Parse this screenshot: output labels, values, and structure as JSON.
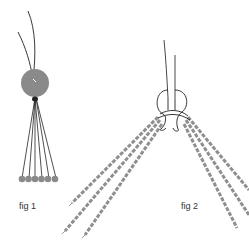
{
  "figures": [
    {
      "id": "fig1",
      "label": "fig 1",
      "description": "Bead with two threads passing through the top and six strands fanning down to a row of six small beads",
      "bead_color": "#8a8a8a",
      "strand_count": 6,
      "thread_color": "#222222"
    },
    {
      "id": "fig2",
      "label": "fig 2",
      "description": "Knot tied around bundled beaded strands splaying out to both sides",
      "strand_color": "#8f8f8f",
      "strands_left": 3,
      "strands_right": 3,
      "thread_color": "#333333"
    }
  ]
}
